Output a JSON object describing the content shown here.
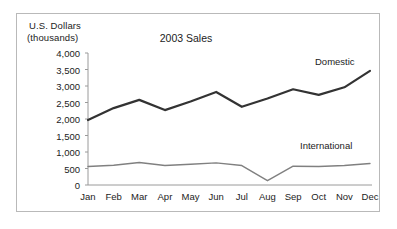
{
  "figure": {
    "background_color": "#ffffff",
    "border_color": "#b9b9b9",
    "text_color": "#1c1c1c"
  },
  "axis_label": {
    "line1": "U.S. Dollars",
    "line2": "(thousands)"
  },
  "series_labels": {
    "domestic": "Domestic",
    "international": "International"
  },
  "chart_data": {
    "type": "line",
    "title": "2003 Sales",
    "xlabel": "",
    "ylabel": "U.S. Dollars (thousands)",
    "categories": [
      "Jan",
      "Feb",
      "Mar",
      "Apr",
      "May",
      "Jun",
      "Jul",
      "Aug",
      "Sep",
      "Oct",
      "Nov",
      "Dec"
    ],
    "ylim": [
      0,
      4000
    ],
    "yticks": [
      0,
      500,
      1000,
      1500,
      2000,
      2500,
      3000,
      3500,
      4000
    ],
    "ytick_labels": [
      "0",
      "500",
      "1,000",
      "1,500",
      "2,000",
      "2,500",
      "3,000",
      "3,500",
      "4,000"
    ],
    "grid": false,
    "legend_position": "inline-right",
    "series": [
      {
        "name": "Domestic",
        "color": "#333333",
        "line_width": 2.2,
        "values": [
          1970,
          2330,
          2580,
          2270,
          2530,
          2820,
          2370,
          2620,
          2900,
          2730,
          2960,
          3460
        ]
      },
      {
        "name": "International",
        "color": "#808080",
        "line_width": 1.4,
        "values": [
          560,
          600,
          680,
          590,
          630,
          670,
          590,
          130,
          570,
          560,
          590,
          650
        ]
      }
    ]
  }
}
